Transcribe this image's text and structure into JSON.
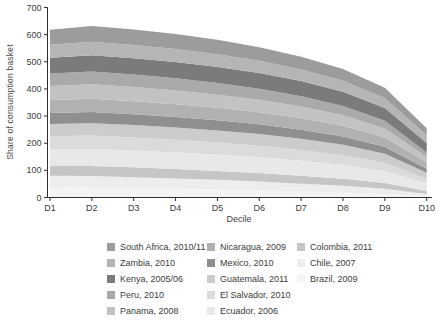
{
  "chart_data": {
    "type": "area",
    "subtype": "stacked-area",
    "title": "",
    "xlabel": "Decile",
    "ylabel": "Share of consumption basket",
    "x_categories": [
      "D1",
      "D2",
      "D3",
      "D4",
      "D5",
      "D6",
      "D7",
      "D8",
      "D9",
      "D10"
    ],
    "y_ticks": [
      0,
      100,
      200,
      300,
      400,
      500,
      600,
      700
    ],
    "ylim": [
      0,
      700
    ],
    "grid": false,
    "legend_position": "bottom",
    "legend_columns": 3,
    "stack_order": "bottom-to-top is reverse of series list (Brazil at bottom, South Africa on top)",
    "axis_color": "#2e2e2e",
    "tick_label_color": "#3d3d3d",
    "series": [
      {
        "name": "south-africa",
        "label": "South Africa, 2010/11",
        "color": "#9c9c9c",
        "values": [
          55,
          58,
          57,
          55,
          53,
          50,
          47,
          43,
          38,
          26
        ]
      },
      {
        "name": "zambia",
        "label": "Zambia, 2010",
        "color": "#b5b5b5",
        "values": [
          48,
          50,
          49,
          48,
          47,
          45,
          43,
          40,
          36,
          28
        ]
      },
      {
        "name": "kenya",
        "label": "Kenya, 2005/06",
        "color": "#7b7b7b",
        "values": [
          58,
          60,
          60,
          60,
          59,
          58,
          56,
          53,
          47,
          35
        ]
      },
      {
        "name": "peru",
        "label": "Peru, 2010",
        "color": "#aaaaaa",
        "values": [
          46,
          47,
          46,
          45,
          43,
          41,
          38,
          34,
          29,
          17
        ]
      },
      {
        "name": "panama",
        "label": "Panama, 2008",
        "color": "#c2c2c2",
        "values": [
          52,
          53,
          52,
          50,
          48,
          46,
          43,
          39,
          33,
          19
        ]
      },
      {
        "name": "nicaragua",
        "label": "Nicaragua, 2009",
        "color": "#b1b1b1",
        "values": [
          48,
          49,
          48,
          47,
          46,
          44,
          42,
          39,
          34,
          24
        ]
      },
      {
        "name": "mexico",
        "label": "Mexico, 2010",
        "color": "#8f8f8f",
        "values": [
          40,
          41,
          40,
          39,
          38,
          36,
          34,
          31,
          26,
          15
        ]
      },
      {
        "name": "guatemala",
        "label": "Guatemala, 2011",
        "color": "#cccccc",
        "values": [
          45,
          46,
          46,
          45,
          44,
          43,
          41,
          38,
          33,
          22
        ]
      },
      {
        "name": "el-salvador",
        "label": "El Salvador, 2010",
        "color": "#dbdbdb",
        "values": [
          48,
          49,
          48,
          47,
          45,
          43,
          40,
          36,
          30,
          17
        ]
      },
      {
        "name": "ecuador",
        "label": "Ecuador, 2006",
        "color": "#e8e8e8",
        "values": [
          62,
          63,
          62,
          61,
          60,
          58,
          55,
          51,
          45,
          28
        ]
      },
      {
        "name": "colombia",
        "label": "Colombia, 2011",
        "color": "#c6c6c6",
        "values": [
          36,
          37,
          36,
          35,
          33,
          31,
          29,
          26,
          21,
          11
        ]
      },
      {
        "name": "chile",
        "label": "Chile, 2007",
        "color": "#ededed",
        "values": [
          42,
          42,
          40,
          38,
          36,
          33,
          29,
          25,
          19,
          8
        ]
      },
      {
        "name": "brazil",
        "label": "Brazil, 2009",
        "color": "#f4f4f4",
        "values": [
          38,
          37,
          35,
          32,
          29,
          26,
          22,
          18,
          13,
          5
        ]
      }
    ]
  }
}
